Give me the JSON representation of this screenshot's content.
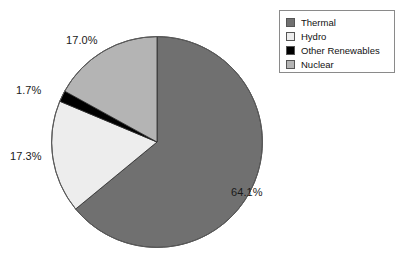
{
  "chart_data": {
    "type": "pie",
    "title": "",
    "categories": [
      "Thermal",
      "Hydro",
      "Other Renewables",
      "Nuclear"
    ],
    "values": [
      64.1,
      17.3,
      1.7,
      17.0
    ],
    "value_labels": [
      "64.1%",
      "17.3%",
      "1.7%",
      "17.0%"
    ],
    "colors": [
      "#707070",
      "#ededed",
      "#000000",
      "#b4b4b4"
    ],
    "units": "percent",
    "start_angle_deg": 0,
    "direction": "clockwise",
    "legend_position": "top-right",
    "grid": false,
    "slices": [
      {
        "label": "Thermal",
        "value": 64.1,
        "value_label": "64.1%",
        "color": "#707070"
      },
      {
        "label": "Hydro",
        "value": 17.3,
        "value_label": "17.3%",
        "color": "#ededed"
      },
      {
        "label": "Other Renewables",
        "value": 1.7,
        "value_label": "1.7%",
        "color": "#000000"
      },
      {
        "label": "Nuclear",
        "value": 17.0,
        "value_label": "17.0%",
        "color": "#b4b4b4"
      }
    ]
  },
  "legend": {
    "items": [
      {
        "label": "Thermal",
        "swatch_color": "#707070",
        "swatch_icon": "legend-swatch-icon"
      },
      {
        "label": "Hydro",
        "swatch_color": "#ededed",
        "swatch_icon": "legend-swatch-icon"
      },
      {
        "label": "Other Renewables",
        "swatch_color": "#000000",
        "swatch_icon": "legend-swatch-icon"
      },
      {
        "label": "Nuclear",
        "swatch_color": "#b4b4b4",
        "swatch_icon": "legend-swatch-icon"
      }
    ]
  },
  "labels": {
    "nuclear": "17.0%",
    "other_renewables": "1.7%",
    "hydro": "17.3%",
    "thermal": "64.1%"
  }
}
